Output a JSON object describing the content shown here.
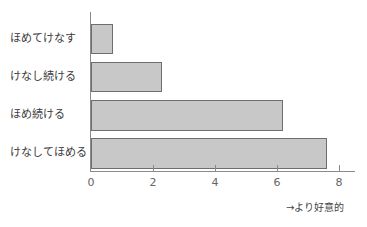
{
  "chart_data": {
    "type": "bar",
    "orientation": "horizontal",
    "title": "",
    "categories": [
      "ほめてけなす",
      "けなし続ける",
      "ほめ続ける",
      "けなしてほめる"
    ],
    "values": [
      0.7,
      2.3,
      6.2,
      7.6
    ],
    "xlabel": "→より好意的",
    "ylabel": "",
    "xlim": [
      0,
      8.5
    ],
    "xticks": [
      "0",
      "2",
      "4",
      "6",
      "8"
    ],
    "grid": false,
    "legend": null,
    "bar_color": "#c8c8c8",
    "bar_edge_color": "#6e6e6e"
  },
  "labels": {
    "cat0": "ほめてけなす",
    "cat1": "けなし続ける",
    "cat2": "ほめ続ける",
    "cat3": "けなしてほめる",
    "tick0": "0",
    "tick1": "2",
    "tick2": "4",
    "tick3": "6",
    "tick4": "8",
    "xlabel": "→より好意的"
  }
}
